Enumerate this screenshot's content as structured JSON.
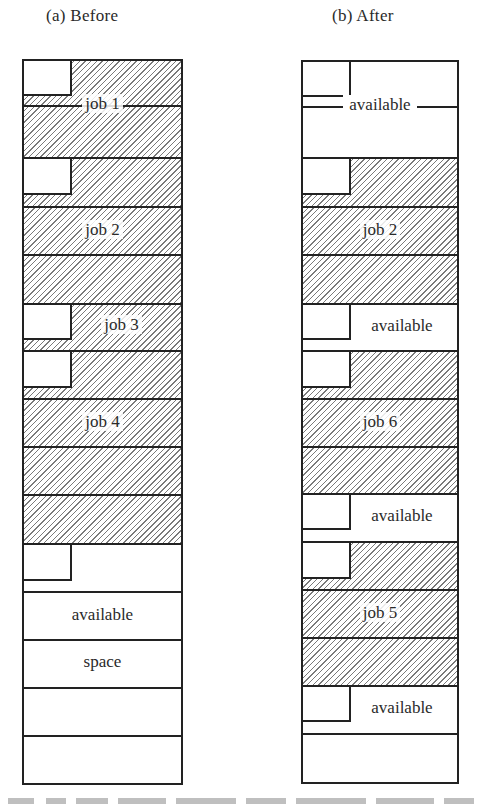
{
  "panels": {
    "before": {
      "caption": "(a) Before",
      "segments": [
        {
          "label": "job 1",
          "type": "job",
          "has_header_box": true
        },
        {
          "label": "job 2",
          "type": "job",
          "has_header_box": true
        },
        {
          "label": "job 3",
          "type": "job",
          "has_header_box": true
        },
        {
          "label": "job 4",
          "type": "job",
          "has_header_box": true
        },
        {
          "label": "available",
          "type": "free",
          "has_header_box": true
        },
        {
          "label": "space",
          "type": "free",
          "has_header_box": false
        }
      ]
    },
    "after": {
      "caption": "(b) After",
      "segments": [
        {
          "label": "available",
          "type": "free",
          "has_header_box": true
        },
        {
          "label": "job 2",
          "type": "job",
          "has_header_box": true
        },
        {
          "label": "available",
          "type": "free",
          "has_header_box": true
        },
        {
          "label": "job 6",
          "type": "job",
          "has_header_box": true
        },
        {
          "label": "available",
          "type": "free",
          "has_header_box": true
        },
        {
          "label": "job 5",
          "type": "job",
          "has_header_box": true
        },
        {
          "label": "available",
          "type": "free",
          "has_header_box": true
        }
      ]
    }
  },
  "colors": {
    "line": "#222222",
    "hatch": "#7a7a7a",
    "background": "#ffffff"
  }
}
